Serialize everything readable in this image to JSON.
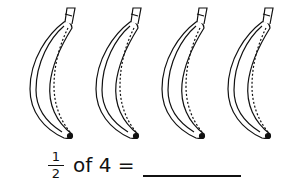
{
  "worksheet": {
    "banana_count": 4,
    "bananas": [
      {
        "label": "banana-1",
        "x": 20
      },
      {
        "label": "banana-2",
        "x": 86
      },
      {
        "label": "banana-3",
        "x": 152
      },
      {
        "label": "banana-4",
        "x": 218
      }
    ],
    "equation": {
      "numerator": "1",
      "denominator": "2",
      "text": "of 4 =",
      "answer": ""
    }
  }
}
